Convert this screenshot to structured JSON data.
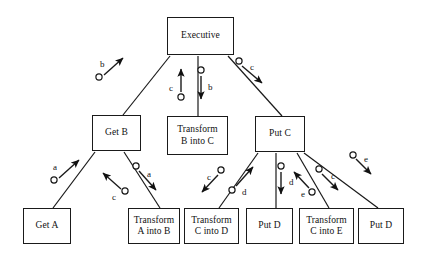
{
  "diagram": {
    "background_color": "#ffffff",
    "line_color": "#1a1a1a",
    "text_color": "#111111",
    "nodes": [
      {
        "id": "executive",
        "label": "Executive",
        "x": 167,
        "y": 17,
        "w": 67,
        "h": 38
      },
      {
        "id": "get-b",
        "label": "Get B",
        "x": 92,
        "y": 115,
        "w": 49,
        "h": 36
      },
      {
        "id": "transform-b-into-c",
        "label": "Transform\nB into C",
        "x": 167,
        "y": 116,
        "w": 61,
        "h": 39
      },
      {
        "id": "put-c",
        "label": "Put C",
        "x": 255,
        "y": 116,
        "w": 50,
        "h": 36
      },
      {
        "id": "get-a",
        "label": "Get A",
        "x": 23,
        "y": 208,
        "w": 48,
        "h": 36
      },
      {
        "id": "transform-a-into-b",
        "label": "Transform\nA into B",
        "x": 128,
        "y": 208,
        "w": 52,
        "h": 36
      },
      {
        "id": "transform-c-into-d",
        "label": "Transform\nC into D",
        "x": 184,
        "y": 208,
        "w": 55,
        "h": 36
      },
      {
        "id": "put-d-left",
        "label": "Put D",
        "x": 246,
        "y": 208,
        "w": 47,
        "h": 36
      },
      {
        "id": "transform-c-into-e",
        "label": "Transform\nC into E",
        "x": 299,
        "y": 208,
        "w": 55,
        "h": 36
      },
      {
        "id": "put-d-right",
        "label": "Put D",
        "x": 358,
        "y": 208,
        "w": 46,
        "h": 36
      }
    ],
    "edges": [
      {
        "id": "executive-get-b",
        "x1": 170,
        "y1": 56,
        "x2": 123,
        "y2": 115
      },
      {
        "id": "executive-transform-b-into-c",
        "x1": 198,
        "y1": 56,
        "x2": 198,
        "y2": 116
      },
      {
        "id": "executive-put-c",
        "x1": 228,
        "y1": 56,
        "x2": 282,
        "y2": 116
      },
      {
        "id": "get-b-get-a",
        "x1": 95,
        "y1": 152,
        "x2": 53,
        "y2": 208
      },
      {
        "id": "get-b-transform-a-into-b",
        "x1": 124,
        "y1": 152,
        "x2": 160,
        "y2": 208
      },
      {
        "id": "put-c-transform-c-into-d",
        "x1": 258,
        "y1": 153,
        "x2": 219,
        "y2": 208
      },
      {
        "id": "put-c-put-d-left",
        "x1": 276,
        "y1": 153,
        "x2": 276,
        "y2": 208
      },
      {
        "id": "put-c-transform-c-into-e",
        "x1": 297,
        "y1": 153,
        "x2": 329,
        "y2": 208
      },
      {
        "id": "put-c-put-d-right",
        "x1": 304,
        "y1": 153,
        "x2": 378,
        "y2": 208
      }
    ],
    "annotations": [
      {
        "id": "ann-b-up-to-executive",
        "letter": "b",
        "lx": 100,
        "ly": 60,
        "cx": 99,
        "cy": 77,
        "ax1": 104,
        "ay1": 75,
        "ax2": 123,
        "ay2": 58
      },
      {
        "id": "ann-c-up-to-executive",
        "letter": "c",
        "lx": 169,
        "ly": 84,
        "cx": 181,
        "cy": 97,
        "ax1": 181,
        "ay1": 92,
        "ax2": 181,
        "ay2": 69
      },
      {
        "id": "ann-b-down-to-transform",
        "letter": "b",
        "lx": 208,
        "ly": 83,
        "cx": 201,
        "cy": 70,
        "ax1": 201,
        "ay1": 76,
        "ax2": 201,
        "ay2": 99
      },
      {
        "id": "ann-c-down-to-put-c",
        "letter": "c",
        "lx": 250,
        "ly": 63,
        "cx": 239,
        "cy": 61,
        "ax1": 242,
        "ay1": 66,
        "ax2": 262,
        "ay2": 83
      },
      {
        "id": "ann-a-up-to-get-b",
        "letter": "a",
        "lx": 53,
        "ly": 163,
        "cx": 54,
        "cy": 180,
        "ax1": 59,
        "ay1": 178,
        "ax2": 79,
        "ay2": 160
      },
      {
        "id": "ann-c-up-to-get-b",
        "letter": "c",
        "lx": 112,
        "ly": 193,
        "cx": 125,
        "cy": 191,
        "ax1": 121,
        "ay1": 189,
        "ax2": 103,
        "ay2": 173
      },
      {
        "id": "ann-a-down-to-transform",
        "letter": "a",
        "lx": 147,
        "ly": 170,
        "cx": 136,
        "cy": 166,
        "ax1": 139,
        "ay1": 171,
        "ax2": 156,
        "ay2": 190
      },
      {
        "id": "ann-c-down-to-transform-cd",
        "letter": "c",
        "lx": 207,
        "ly": 173,
        "cx": 221,
        "cy": 170,
        "ax1": 218,
        "ay1": 175,
        "ax2": 202,
        "ay2": 192
      },
      {
        "id": "ann-d-up-to-put-c",
        "letter": "d",
        "lx": 242,
        "ly": 188,
        "cx": 232,
        "cy": 190,
        "ax1": 236,
        "ay1": 186,
        "ax2": 253,
        "ay2": 167
      },
      {
        "id": "ann-d-down-to-put-d",
        "letter": "d",
        "lx": 289,
        "ly": 178,
        "cx": 281,
        "cy": 166,
        "ax1": 281,
        "ay1": 172,
        "ax2": 281,
        "ay2": 194
      },
      {
        "id": "ann-e-up-to-put-c",
        "letter": "e",
        "lx": 301,
        "ly": 190,
        "cx": 312,
        "cy": 192,
        "ax1": 309,
        "ay1": 188,
        "ax2": 294,
        "ay2": 172
      },
      {
        "id": "ann-c-down-to-transform-ce",
        "letter": "c",
        "lx": 331,
        "ly": 172,
        "cx": 319,
        "cy": 169,
        "ax1": 322,
        "ay1": 174,
        "ax2": 338,
        "ay2": 190
      },
      {
        "id": "ann-e-down-to-put-d",
        "letter": "e",
        "lx": 364,
        "ly": 155,
        "cx": 353,
        "cy": 155,
        "ax1": 356,
        "ay1": 159,
        "ax2": 371,
        "ay2": 174
      }
    ]
  }
}
